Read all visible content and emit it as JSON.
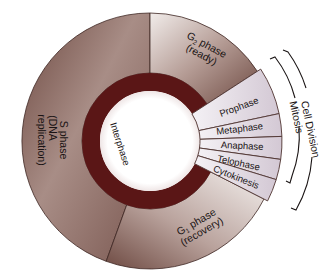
{
  "diagram": {
    "center_label": "Interphase",
    "phases": [
      {
        "id": "g2",
        "name": "G",
        "sub": "2",
        "suffix": " phase",
        "note": "(ready)"
      },
      {
        "id": "s",
        "name": "S phase",
        "note_line1": "(DNA",
        "note_line2": "replication)"
      },
      {
        "id": "g1",
        "name": "G",
        "sub": "1",
        "suffix": " phase",
        "note": "(recovery)"
      }
    ],
    "mitosis_stages": [
      "Prophase",
      "Metaphase",
      "Anaphase",
      "Telophase",
      "Cytokinesis"
    ],
    "brackets": {
      "outer": "Cell Division",
      "inner": "Mitosis"
    },
    "colors": {
      "outer_ring_dark": "#6e4a42",
      "outer_ring_light": "#d9cfcb",
      "inner_ring": "#5a1616",
      "mitosis_fill": "#e4dde6",
      "mitosis_stroke": "#5a3a36",
      "center": "#ffffff"
    }
  }
}
